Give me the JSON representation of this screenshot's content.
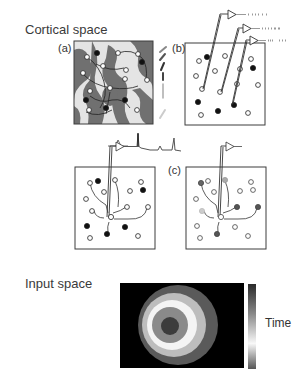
{
  "sections": {
    "cortical": {
      "title": "Cortical space"
    },
    "input": {
      "title": "Input space"
    }
  },
  "panels": {
    "a": {
      "label": "(a)"
    },
    "b": {
      "label": "(b)"
    },
    "c": {
      "label": "(c)"
    }
  },
  "colorbar": {
    "label": "Time"
  },
  "colors": {
    "frame": "#3c3c3c",
    "filled_neuron": "#111111",
    "open_neuron": "#ffffff",
    "map_dark": "#6f6f6f",
    "map_light": "#e6e6e6",
    "input_bg": "#000000",
    "ring_outer": "#5a5a5a",
    "ring_2": "#bdbdbd",
    "ring_3": "#f4f4f4",
    "ring_4": "#8a8a8a",
    "ring_center": "#3c3c3c"
  }
}
